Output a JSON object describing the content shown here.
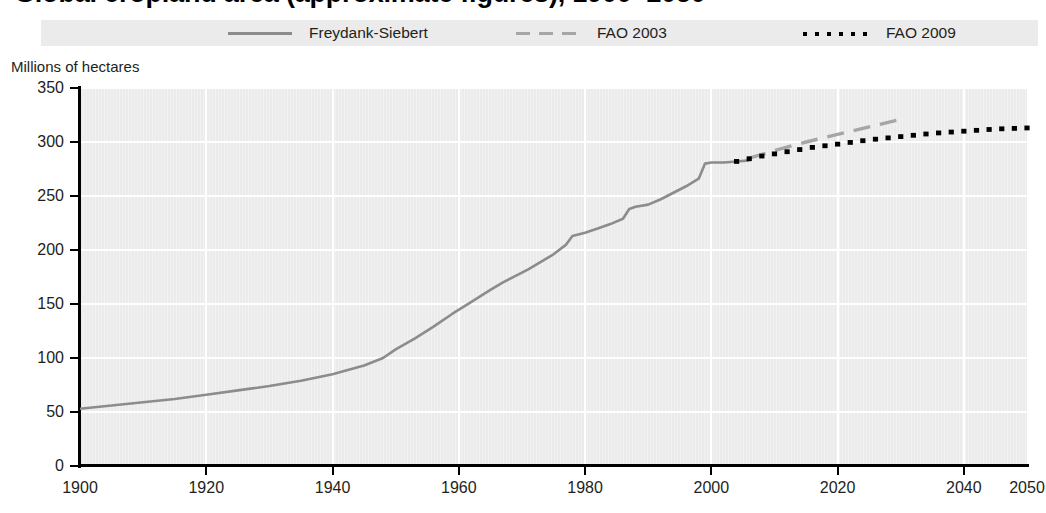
{
  "title": {
    "text_fragment_clipped": "Global cropland area (approximate figures), 1900–2050"
  },
  "axis": {
    "ylabel": "Millions of hectares",
    "yticks": [
      0,
      50,
      100,
      150,
      200,
      250,
      300,
      350
    ],
    "xticks": [
      1900,
      1920,
      1940,
      1960,
      1980,
      2000,
      2020,
      2040,
      2050
    ]
  },
  "legend": {
    "items": [
      {
        "label": "Freydank-Siebert",
        "style": "solid",
        "color": "#8c8c8c",
        "icon": "solid-line-swatch"
      },
      {
        "label": "FAO 2003",
        "style": "dashed",
        "color": "#a6a6a6",
        "icon": "dashed-line-swatch"
      },
      {
        "label": "FAO 2009",
        "style": "dotted",
        "color": "#000000",
        "icon": "dotted-line-swatch"
      }
    ]
  },
  "chart_data": {
    "type": "line",
    "title": "Global cropland area (approximate figures), 1900–2050",
    "xlabel": "",
    "ylabel": "Millions of hectares",
    "xlim": [
      1900,
      2050
    ],
    "ylim": [
      0,
      350
    ],
    "grid": true,
    "legend_position": "top",
    "series": [
      {
        "name": "Freydank-Siebert",
        "style": "solid",
        "color": "#8c8c8c",
        "x": [
          1900,
          1905,
          1910,
          1915,
          1920,
          1925,
          1930,
          1935,
          1940,
          1945,
          1948,
          1950,
          1953,
          1956,
          1959,
          1962,
          1965,
          1967,
          1969,
          1971,
          1973,
          1975,
          1977,
          1978,
          1980,
          1982,
          1984,
          1986,
          1987,
          1988,
          1990,
          1992,
          1994,
          1996,
          1998,
          1999,
          2000,
          2002,
          2004,
          2006
        ],
        "y": [
          53,
          56,
          59,
          62,
          66,
          70,
          74,
          79,
          85,
          93,
          100,
          108,
          118,
          129,
          141,
          152,
          163,
          170,
          176,
          182,
          189,
          196,
          205,
          213,
          216,
          220,
          224,
          229,
          238,
          240,
          242,
          247,
          253,
          259,
          266,
          280,
          281,
          281,
          282,
          283
        ]
      },
      {
        "name": "FAO 2003",
        "style": "dashed",
        "color": "#a6a6a6",
        "x": [
          2006,
          2010,
          2015,
          2020,
          2025,
          2030
        ],
        "y": [
          285,
          292,
          300,
          307,
          314,
          321
        ]
      },
      {
        "name": "FAO 2009",
        "style": "dotted",
        "color": "#000000",
        "x": [
          2004,
          2008,
          2012,
          2016,
          2020,
          2025,
          2030,
          2035,
          2040,
          2045,
          2050
        ],
        "y": [
          282,
          287,
          291,
          295,
          298,
          302,
          305,
          308,
          310,
          312,
          313
        ]
      }
    ]
  }
}
